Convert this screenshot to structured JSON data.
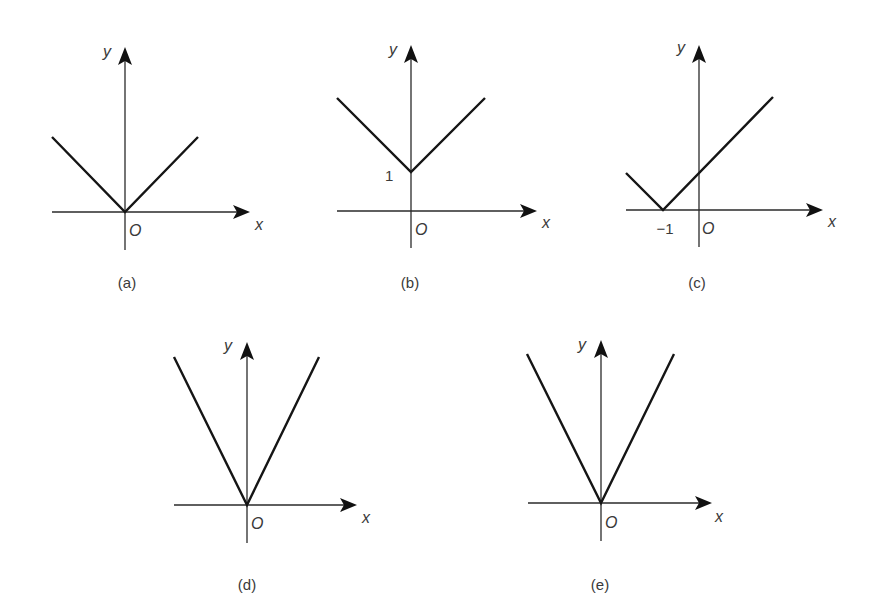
{
  "figure": {
    "axis_labels": {
      "x": "x",
      "y": "y",
      "origin": "O"
    },
    "graphs": [
      {
        "id": "a",
        "caption": "(a)",
        "shape": "V with vertex at origin, slope ±1",
        "vertex": [
          0,
          0
        ],
        "tick_labels": []
      },
      {
        "id": "b",
        "caption": "(b)",
        "shape": "V with vertex at (0, 1), slope ±1",
        "vertex": [
          0,
          1
        ],
        "tick_labels": [
          {
            "axis": "y",
            "text": "1"
          }
        ]
      },
      {
        "id": "c",
        "caption": "(c)",
        "shape": "V with vertex at (-1, 0), slope ±1",
        "vertex": [
          -1,
          0
        ],
        "tick_labels": [
          {
            "axis": "x",
            "text": "−1"
          }
        ]
      },
      {
        "id": "d",
        "caption": "(d)",
        "shape": "Steep V with vertex at origin",
        "vertex": [
          0,
          0
        ],
        "tick_labels": []
      },
      {
        "id": "e",
        "caption": "(e)",
        "shape": "Steep V with vertex at origin",
        "vertex": [
          0,
          0
        ],
        "tick_labels": []
      }
    ]
  },
  "colors": {
    "line": "#151515",
    "axis": "#2a2a2a",
    "text": "#3a3a3a",
    "background": "#ffffff"
  }
}
